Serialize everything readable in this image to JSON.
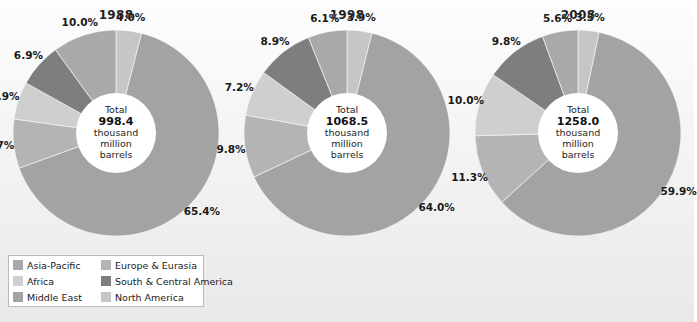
{
  "panel": {
    "background": "#f1f1f1"
  },
  "legend": {
    "items": [
      {
        "label": "Asia-Pacific",
        "color": "#a9a9a9"
      },
      {
        "label": "Europe & Eurasia",
        "color": "#b4b4b4"
      },
      {
        "label": "Africa",
        "color": "#cfcfcf"
      },
      {
        "label": "South & Central America",
        "color": "#7e7e7e"
      },
      {
        "label": "Middle East",
        "color": "#a3a3a3"
      },
      {
        "label": "North America",
        "color": "#c6c6c6"
      }
    ]
  },
  "chart_data": [
    {
      "type": "pie",
      "title": "1988",
      "center_label": "Total",
      "center_value": "998.4",
      "center_unit_line1": "thousand",
      "center_unit_line2": "million",
      "center_unit_line3": "barrels",
      "total": 998.4,
      "unit": "thousand million barrels",
      "categories": [
        "North America",
        "Middle East",
        "Europe & Eurasia",
        "Africa",
        "South & Central America",
        "Asia-Pacific"
      ],
      "values": [
        4.0,
        65.4,
        7.7,
        5.9,
        6.9,
        10.0
      ],
      "labels": [
        "4.0%",
        "65.4%",
        "7.7%",
        "5.9%",
        "6.9%",
        "10.0%"
      ],
      "colors": [
        "#c6c6c6",
        "#a3a3a3",
        "#b4b4b4",
        "#cfcfcf",
        "#7e7e7e",
        "#a9a9a9"
      ],
      "legend_position": "bottom-left",
      "grid": false
    },
    {
      "type": "pie",
      "title": "1998",
      "center_label": "Total",
      "center_value": "1068.5",
      "center_unit_line1": "thousand",
      "center_unit_line2": "million",
      "center_unit_line3": "barrels",
      "total": 1068.5,
      "unit": "thousand million barrels",
      "categories": [
        "North America",
        "Middle East",
        "Europe & Eurasia",
        "Africa",
        "South & Central America",
        "Asia-Pacific"
      ],
      "values": [
        3.9,
        64.0,
        9.8,
        7.2,
        8.9,
        6.1
      ],
      "labels": [
        "3.9%",
        "64.0%",
        "9.8%",
        "7.2%",
        "8.9%",
        "6.1%"
      ],
      "colors": [
        "#c6c6c6",
        "#a3a3a3",
        "#b4b4b4",
        "#cfcfcf",
        "#7e7e7e",
        "#a9a9a9"
      ],
      "legend_position": "bottom-left",
      "grid": false
    },
    {
      "type": "pie",
      "title": "2008",
      "center_label": "Total",
      "center_value": "1258.0",
      "center_unit_line1": "thousand",
      "center_unit_line2": "million",
      "center_unit_line3": "barrels",
      "total": 1258.0,
      "unit": "thousand million barrels",
      "categories": [
        "North America",
        "Middle East",
        "Europe & Eurasia",
        "Africa",
        "South & Central America",
        "Asia-Pacific"
      ],
      "values": [
        3.3,
        59.9,
        11.3,
        10.0,
        9.8,
        5.6
      ],
      "labels": [
        "3.3%",
        "59.9%",
        "11.3%",
        "10.0%",
        "9.8%",
        "5.6%"
      ],
      "colors": [
        "#c6c6c6",
        "#a3a3a3",
        "#b4b4b4",
        "#cfcfcf",
        "#7e7e7e",
        "#a9a9a9"
      ],
      "legend_position": "bottom-left",
      "grid": false
    }
  ]
}
